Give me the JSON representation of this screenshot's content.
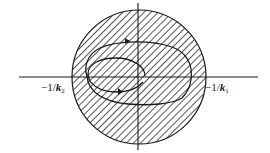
{
  "diagram": {
    "type": "nyquist-circle-criterion",
    "colors": {
      "stroke": "#1a1a1a",
      "hatch": "#2a2a2a",
      "background": "#ffffff"
    },
    "labels": {
      "left": {
        "prefix": "−1/",
        "var": "k",
        "sub": "2"
      },
      "right": {
        "prefix": "−1/",
        "var": "k",
        "sub": "1"
      }
    },
    "axes": {
      "horizontal": {
        "x1": 19,
        "x2": 258,
        "y": 77
      },
      "vertical": {
        "x": 138,
        "y1": 3,
        "y2": 150
      }
    },
    "disk": {
      "cx": 139,
      "cy": 77,
      "r": 67,
      "hatch": "diagonal"
    },
    "curves": [
      {
        "name": "outer-loop",
        "cx": 139,
        "cy": 74,
        "rx": 54,
        "ry": 31
      },
      {
        "name": "inner-loop",
        "cx": 116,
        "cy": 75,
        "rx": 29,
        "ry": 17
      }
    ]
  }
}
